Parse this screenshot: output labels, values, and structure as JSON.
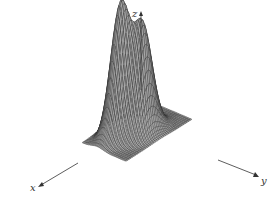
{
  "figure": {
    "type": "3d-surface",
    "colors": {
      "surface_fill": "#a9a9a9",
      "mesh_line": "#2b2b2b",
      "axis_line": "#333333",
      "background": "#ffffff"
    },
    "axes": {
      "x": {
        "label": "x"
      },
      "y": {
        "label": "y"
      },
      "z": {
        "label": "z"
      }
    },
    "grid": {
      "n": 40,
      "range": [
        -3,
        3
      ]
    },
    "peaks": [
      {
        "name": "left-peak",
        "cx": 0.9,
        "cy": -0.9,
        "height": 1.0,
        "sigma": 0.75
      },
      {
        "name": "right-peak",
        "cx": -0.1,
        "cy": 0.6,
        "height": 0.82,
        "sigma": 0.75
      }
    ]
  },
  "chart_data": {
    "type": "surface",
    "title": "",
    "xlabel": "x",
    "ylabel": "y",
    "zlabel": "z",
    "features": [
      "two Gaussian-like peaks",
      "saddle/valley between peaks",
      "flat base plane"
    ],
    "grid": "on (wireframe mesh)",
    "legend": "none"
  }
}
